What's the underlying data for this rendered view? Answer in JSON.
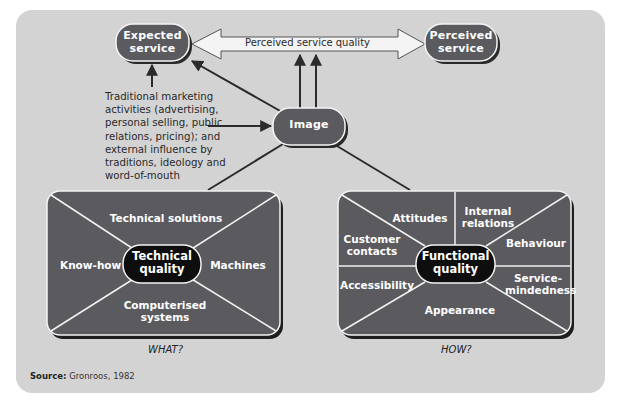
{
  "colors": {
    "panel_bg": "#d3d3d3",
    "node_fill": "#5a5a5f",
    "center_fill": "#111111",
    "line": "#2b2b2b",
    "divider": "#f2f2f2"
  },
  "nodes": {
    "expected_service": {
      "line1": "Expected",
      "line2": "service"
    },
    "perceived_service": {
      "line1": "Perceived",
      "line2": "service"
    },
    "image": {
      "label": "Image"
    }
  },
  "arrow": {
    "label": "Perceived service quality"
  },
  "influences": {
    "text": "Traditional marketing activities (advertising, personal selling, public relations, pricing); and external influence by traditions, ideology and word-of-mouth"
  },
  "technical_box": {
    "center": {
      "line1": "Technical",
      "line2": "quality"
    },
    "segments": {
      "top": "Technical solutions",
      "left": "Know-how",
      "right": "Machines",
      "bottom_line1": "Computerised",
      "bottom_line2": "systems"
    },
    "caption": "WHAT?"
  },
  "functional_box": {
    "center": {
      "line1": "Functional",
      "line2": "quality"
    },
    "segments": {
      "attitudes": "Attitudes",
      "internal_line1": "Internal",
      "internal_line2": "relations",
      "customer_line1": "Customer",
      "customer_line2": "contacts",
      "behaviour": "Behaviour",
      "accessibility": "Accessibility",
      "service_line1": "Service-",
      "service_line2": "mindedness",
      "appearance": "Appearance"
    },
    "caption": "HOW?"
  },
  "source": {
    "label": "Source:",
    "text": "Gronroos, 1982"
  }
}
